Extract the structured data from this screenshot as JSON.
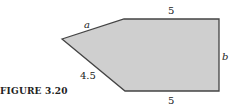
{
  "figure": {
    "caption": "FIGURE 3.20",
    "fill_color": "#cfcfcf",
    "stroke_color": "#444444",
    "labels": {
      "top": "5",
      "bottom": "5",
      "right": "b",
      "upper_left": "a",
      "lower_left": "4.5"
    },
    "vertices": [
      [
        62,
        39
      ],
      [
        124,
        19
      ],
      [
        219,
        19
      ],
      [
        219,
        91
      ],
      [
        125,
        91
      ]
    ]
  }
}
